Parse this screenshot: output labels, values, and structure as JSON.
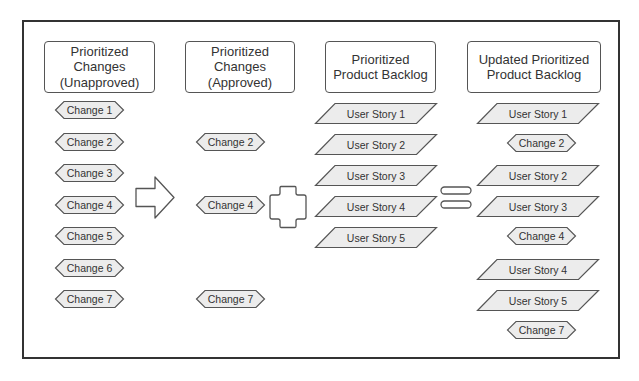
{
  "colors": {
    "frame": "#333333",
    "shape_fill": "#ececec",
    "shape_stroke": "#555555",
    "text": "#333333"
  },
  "columns": [
    {
      "title": "Prioritized\nChanges\n(Unapproved)",
      "items": [
        {
          "type": "change",
          "label": "Change 1"
        },
        {
          "type": "change",
          "label": "Change 2"
        },
        {
          "type": "change",
          "label": "Change 3"
        },
        {
          "type": "change",
          "label": "Change 4"
        },
        {
          "type": "change",
          "label": "Change 5"
        },
        {
          "type": "change",
          "label": "Change 6"
        },
        {
          "type": "change",
          "label": "Change 7"
        }
      ]
    },
    {
      "title": "Prioritized\nChanges\n(Approved)",
      "items": [
        {
          "type": "change",
          "label": "Change 2"
        },
        {
          "type": "change",
          "label": "Change 4"
        },
        {
          "type": "change",
          "label": "Change 7"
        }
      ]
    },
    {
      "title": "Prioritized\nProduct Backlog",
      "items": [
        {
          "type": "story",
          "label": "User Story 1"
        },
        {
          "type": "story",
          "label": "User Story 2"
        },
        {
          "type": "story",
          "label": "User Story 3"
        },
        {
          "type": "story",
          "label": "User Story 4"
        },
        {
          "type": "story",
          "label": "User Story 5"
        }
      ]
    },
    {
      "title": "Updated Prioritized\nProduct Backlog",
      "items": [
        {
          "type": "story",
          "label": "User Story 1"
        },
        {
          "type": "change",
          "label": "Change 2"
        },
        {
          "type": "story",
          "label": "User Story 2"
        },
        {
          "type": "story",
          "label": "User Story 3"
        },
        {
          "type": "change",
          "label": "Change 4"
        },
        {
          "type": "story",
          "label": "User Story 4"
        },
        {
          "type": "story",
          "label": "User Story 5"
        },
        {
          "type": "change",
          "label": "Change 7"
        }
      ]
    }
  ],
  "operators": {
    "arrow": "right-arrow",
    "plus": "plus",
    "equals": "equals"
  }
}
